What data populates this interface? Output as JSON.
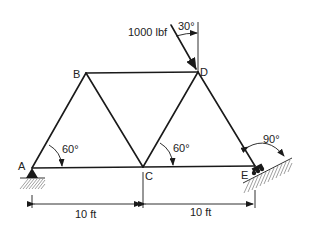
{
  "diagram": {
    "type": "truss",
    "nodes": [
      {
        "id": "A",
        "label": "A"
      },
      {
        "id": "B",
        "label": "B"
      },
      {
        "id": "C",
        "label": "C"
      },
      {
        "id": "D",
        "label": "D"
      },
      {
        "id": "E",
        "label": "E"
      }
    ],
    "members": [
      "AB",
      "BC",
      "AC",
      "BD",
      "CD",
      "DE",
      "CE"
    ],
    "load": {
      "label": "1000 lbf",
      "angle_label": "30°",
      "node": "D"
    },
    "angles": [
      {
        "label": "60°",
        "at": "A"
      },
      {
        "label": "60°",
        "at": "C"
      },
      {
        "label": "90°",
        "at": "E"
      }
    ],
    "supports": [
      {
        "node": "A",
        "type": "pin"
      },
      {
        "node": "E",
        "type": "roller on incline"
      }
    ],
    "dimensions": [
      {
        "label": "10 ft",
        "from": "A",
        "to": "C"
      },
      {
        "label": "10 ft",
        "from": "C",
        "to": "E"
      }
    ]
  }
}
